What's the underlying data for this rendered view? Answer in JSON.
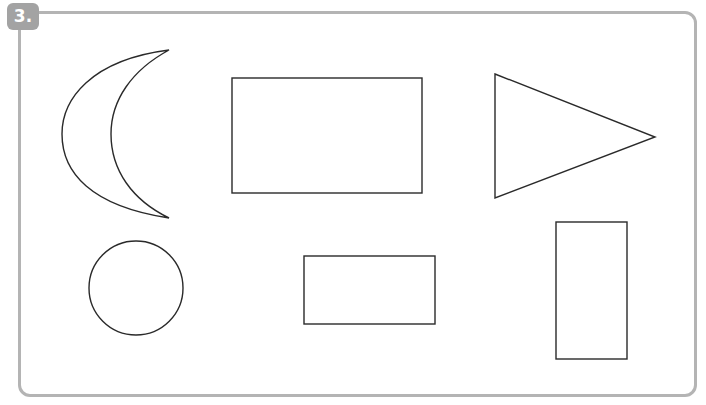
{
  "exercise": {
    "number_label": "3.",
    "badge_color": "#a3a3a3",
    "frame_color": "#b4b4b4",
    "stroke_color": "#2a2a2a"
  },
  "shapes": [
    {
      "name": "crescent",
      "type": "crescent"
    },
    {
      "name": "large-rectangle",
      "type": "rectangle"
    },
    {
      "name": "triangle",
      "type": "triangle"
    },
    {
      "name": "circle",
      "type": "circle"
    },
    {
      "name": "small-rectangle",
      "type": "rectangle"
    },
    {
      "name": "tall-rectangle",
      "type": "rectangle"
    }
  ]
}
